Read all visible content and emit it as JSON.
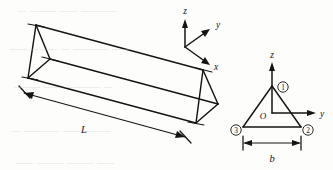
{
  "figure": {
    "caption_absent": true,
    "prism": {
      "length_label": "L",
      "description": "triangular prism in oblique projection"
    },
    "triad": {
      "z_label": "z",
      "y_label": "y",
      "x_label": "x"
    },
    "cross_section": {
      "origin_label": "O",
      "z_axis_label": "z",
      "y_axis_label": "y",
      "base_label": "b",
      "vertices": [
        {
          "id": "1",
          "marker": "①",
          "position": "apex"
        },
        {
          "id": "2",
          "marker": "②",
          "position": "bottom-right"
        },
        {
          "id": "3",
          "marker": "③",
          "position": "bottom-left"
        }
      ]
    },
    "colors": {
      "ink": "#141414",
      "paper": "#fdfdfc",
      "bleed": "#c9c7c2"
    },
    "background_bleed": [
      {
        "text": "— ——— —— ————",
        "x": 18,
        "y": 6
      },
      {
        "text": "—— ——— — ———— ——",
        "x": 10,
        "y": 44
      },
      {
        "text": "——— —— ———— —",
        "x": 14,
        "y": 82
      },
      {
        "text": "— ———— —— ———",
        "x": 12,
        "y": 126
      },
      {
        "text": "—— ——— ——— ——",
        "x": 16,
        "y": 158
      }
    ]
  }
}
